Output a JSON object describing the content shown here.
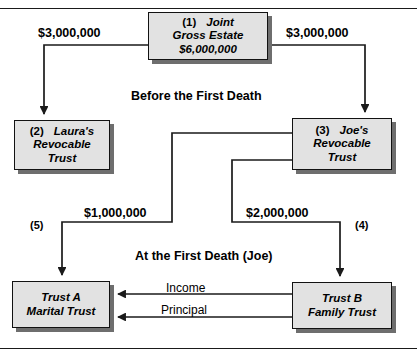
{
  "diagram": {
    "colors": {
      "node_fill": "#e2e2e2",
      "node_border": "#121212",
      "node_shadow": "#6e6e6e",
      "line": "#1a1a1a",
      "background": "#ffffff"
    },
    "section_titles": {
      "before": "Before the First Death",
      "at_first_death": "At the First Death (Joe)"
    },
    "nodes": {
      "joint_estate": {
        "index": "(1)",
        "line1": "Joint",
        "line2": "Gross Estate",
        "line3": "$6,000,000"
      },
      "laura_trust": {
        "index": "(2)",
        "line1": "Laura's",
        "line2": "Revocable",
        "line3": "Trust"
      },
      "joe_trust": {
        "index": "(3)",
        "line1": "Joe's",
        "line2": "Revocable",
        "line3": "Trust"
      },
      "trust_a": {
        "line1": "Trust  A",
        "line2": "Marital Trust"
      },
      "trust_b": {
        "line1": "Trust  B",
        "line2": "Family Trust"
      }
    },
    "amounts": {
      "to_laura": "$3,000,000",
      "to_joe": "$3,000,000",
      "to_trust_a": "$1,000,000",
      "to_trust_b": "$2,000,000"
    },
    "step_markers": {
      "marker_five": "(5)",
      "marker_four": "(4)"
    },
    "flows": {
      "income": "Income",
      "principal": "Principal"
    }
  }
}
